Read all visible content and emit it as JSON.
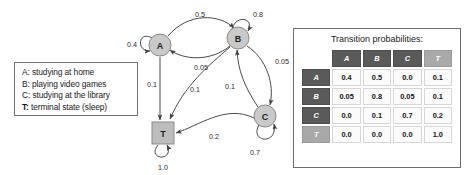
{
  "legend": {
    "entries": [
      {
        "key": "A:",
        "text": " studying at home",
        "bold": false
      },
      {
        "key": "B:",
        "text": " playing video games",
        "bold": false
      },
      {
        "key": "C:",
        "text": " studying at the library",
        "bold": false
      },
      {
        "key": "T:",
        "text": " terminal state (sleep)",
        "bold": true
      }
    ]
  },
  "diagram": {
    "nodes": [
      {
        "id": "A",
        "label": "A",
        "shape": "circle",
        "cx": 48,
        "cy": 45,
        "r": 11,
        "fill": "#c9c9c9"
      },
      {
        "id": "B",
        "label": "B",
        "shape": "circle",
        "cx": 126,
        "cy": 38,
        "r": 11,
        "fill": "#c9c9c9"
      },
      {
        "id": "C",
        "label": "C",
        "shape": "circle",
        "cx": 153,
        "cy": 116,
        "r": 11,
        "fill": "#c9c9c9"
      },
      {
        "id": "T",
        "label": "T",
        "shape": "square",
        "cx": 51,
        "cy": 133,
        "r": 11,
        "fill": "#bdbdbd"
      }
    ],
    "edge_labels": {
      "a_a": "0.4",
      "a_b": "0.5",
      "a_t": "0.1",
      "b_b": "0.8",
      "b_a": "0.05",
      "b_c": "0.05",
      "b_t": "0.1",
      "c_b": "0.1",
      "c_c": "0.7",
      "c_t": "0.2",
      "t_t": "1.0"
    }
  },
  "table": {
    "title": "Transition probabilities:",
    "col_headers": [
      "A",
      "B",
      "C",
      "T"
    ],
    "row_headers": [
      "A",
      "B",
      "C",
      "T"
    ],
    "rows": [
      [
        "0.4",
        "0.5",
        "0.0",
        "0.1"
      ],
      [
        "0.05",
        "0.8",
        "0.05",
        "0.1"
      ],
      [
        "0.0",
        "0.1",
        "0.7",
        "0.2"
      ],
      [
        "0.0",
        "0.0",
        "0.0",
        "1.0"
      ]
    ]
  },
  "colors": {
    "node_fill": "#c9c9c9",
    "terminal_fill": "#bdbdbd",
    "header_dark": "#5a5a5a",
    "header_light": "#a9a9a9",
    "cell_bg": "#fbfbfb",
    "stroke": "#4a4a4a"
  }
}
